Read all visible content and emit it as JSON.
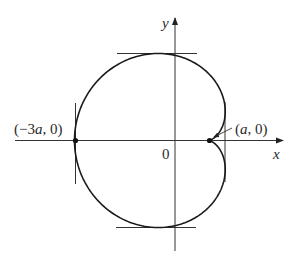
{
  "figure": {
    "type": "cardioid",
    "axes": {
      "x_label": "x",
      "y_label": "y",
      "origin_label": "0"
    },
    "points": [
      {
        "name": "leftmost-point",
        "label": "(−3a, 0)"
      },
      {
        "name": "cusp-point",
        "label": "(a, 0)"
      }
    ],
    "tangents": [
      "top-horizontal",
      "bottom-horizontal",
      "left-vertical",
      "right-vertical"
    ],
    "colors": {
      "curve": "#1a1a1a",
      "axes": "#333333",
      "background": "#ffffff"
    }
  }
}
